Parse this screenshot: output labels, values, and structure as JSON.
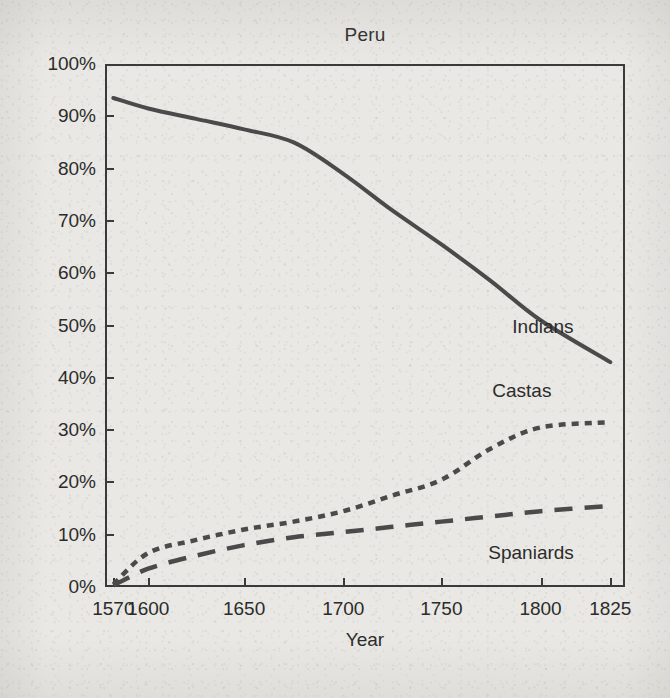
{
  "chart_data": {
    "type": "line",
    "title": "Peru",
    "xlabel": "Year",
    "ylabel": "",
    "xlim": [
      1570,
      1825
    ],
    "ylim": [
      0,
      100
    ],
    "grid": false,
    "legend_position": "inline-labels",
    "x_tick_labels": [
      "1570",
      "1600",
      "1650",
      "1700",
      "1750",
      "1800",
      "1825"
    ],
    "x_ticks": [
      1570,
      1600,
      1650,
      1700,
      1750,
      1800,
      1825
    ],
    "y_tick_labels": [
      "0%",
      "10%",
      "20%",
      "30%",
      "40%",
      "50%",
      "60%",
      "70%",
      "80%",
      "90%",
      "100%"
    ],
    "y_ticks": [
      0,
      10,
      20,
      30,
      40,
      50,
      60,
      70,
      80,
      90,
      100
    ],
    "units": "percent of population",
    "series": [
      {
        "name": "Indians",
        "style": "solid",
        "color": "#4a4a4a",
        "x": [
          1570,
          1600,
          1625,
          1650,
          1675,
          1700,
          1725,
          1750,
          1775,
          1800,
          1825
        ],
        "values": [
          93.5,
          91.5,
          89.5,
          87.5,
          85.0,
          79.0,
          72.0,
          65.5,
          58.5,
          51.0,
          43.0
        ]
      },
      {
        "name": "Castas",
        "style": "dotted",
        "color": "#4a4a4a",
        "x": [
          1570,
          1600,
          1625,
          1650,
          1675,
          1700,
          1725,
          1750,
          1775,
          1800,
          1825
        ],
        "values": [
          0.5,
          6.5,
          9.0,
          11.0,
          12.5,
          14.5,
          17.5,
          20.5,
          26.5,
          30.5,
          31.5
        ]
      },
      {
        "name": "Spaniards",
        "style": "dashed",
        "color": "#4a4a4a",
        "x": [
          1570,
          1600,
          1625,
          1650,
          1675,
          1700,
          1725,
          1750,
          1775,
          1800,
          1825
        ],
        "values": [
          0.3,
          3.5,
          6.0,
          8.0,
          9.5,
          10.5,
          11.5,
          12.5,
          13.5,
          14.5,
          15.5
        ]
      }
    ],
    "annotations": [
      {
        "text": "Indians",
        "series": "Indians"
      },
      {
        "text": "Castas",
        "series": "Castas"
      },
      {
        "text": "Spaniards",
        "series": "Spaniards"
      }
    ]
  },
  "colors": {
    "background": "#e9e8e4",
    "axis": "#3a3a3a",
    "text": "#2b2b2b",
    "line": "#4a4a4a"
  }
}
